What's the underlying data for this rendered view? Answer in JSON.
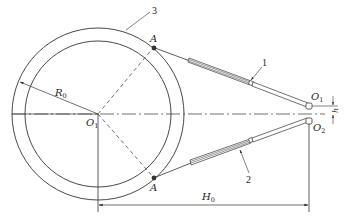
{
  "diagram": {
    "type": "mechanism-schematic",
    "labels": {
      "ring_number": "3",
      "rod_upper_number": "1",
      "rod_lower_number": "2",
      "point_a_upper": "A",
      "point_a_lower": "A",
      "center": "O",
      "center_sub": "1",
      "pivot_upper": "O",
      "pivot_upper_sub": "1",
      "pivot_lower": "O",
      "pivot_lower_sub": "2",
      "radius": "R",
      "radius_sub": "0",
      "height_dim": "H",
      "height_dim_sub": "0",
      "offset_dim": "h"
    },
    "colors": {
      "line": "#333333",
      "background": "#ffffff"
    }
  }
}
